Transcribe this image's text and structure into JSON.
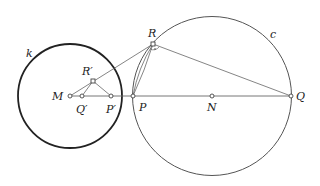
{
  "diagram": {
    "circles": {
      "k": {
        "label": "k",
        "cx": 70,
        "cy": 96,
        "r": 52
      },
      "c": {
        "label": "c",
        "cx": 212,
        "cy": 96,
        "r": 80
      }
    },
    "points": {
      "M": {
        "label": "M",
        "x": 70,
        "y": 96
      },
      "Q_prime": {
        "label": "Q′",
        "x": 82,
        "y": 96
      },
      "P_prime": {
        "label": "P′",
        "x": 111,
        "y": 96
      },
      "P": {
        "label": "P",
        "x": 133,
        "y": 96
      },
      "N": {
        "label": "N",
        "x": 212,
        "y": 96
      },
      "Q": {
        "label": "Q",
        "x": 291,
        "y": 96
      },
      "R_prime": {
        "label": "R′",
        "x": 93,
        "y": 81
      },
      "R": {
        "label": "R",
        "x": 153,
        "y": 44
      }
    },
    "colors": {
      "circle_k": "#222222",
      "circle_c": "#555555",
      "lines": "#666666"
    }
  }
}
